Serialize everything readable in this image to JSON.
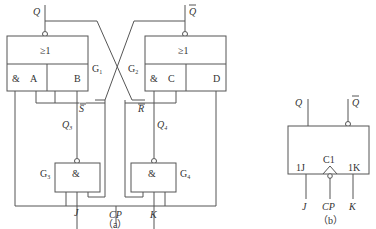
{
  "diagram_a": {
    "caption": "（a）",
    "outputs": {
      "q": "Q",
      "q_bar": "Q"
    },
    "gates": {
      "g1": {
        "label": "G",
        "sub": "1",
        "symbol": "≥1",
        "and_symbol": "&",
        "input_a": "A",
        "input_b": "B"
      },
      "g2": {
        "label": "G",
        "sub": "2",
        "symbol": "≥1",
        "and_symbol": "&",
        "input_c": "C",
        "input_d": "D"
      },
      "g3": {
        "label": "G",
        "sub": "3",
        "symbol": "&",
        "output_label": "Q",
        "output_sub": "3",
        "signal": "S"
      },
      "g4": {
        "label": "G",
        "sub": "4",
        "symbol": "&",
        "output_label": "Q",
        "output_sub": "4",
        "signal": "R"
      }
    },
    "inputs": {
      "j": "J",
      "cp": "CP",
      "k": "K"
    }
  },
  "diagram_b": {
    "caption": "（b）",
    "outputs": {
      "q": "Q",
      "q_bar": "Q"
    },
    "pins": {
      "j_pin": "1J",
      "clock_pin": "C1",
      "k_pin": "1K"
    },
    "inputs": {
      "j": "J",
      "cp": "CP",
      "k": "K"
    }
  }
}
